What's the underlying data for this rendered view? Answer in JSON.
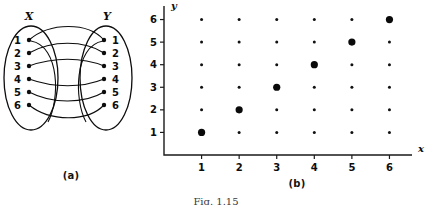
{
  "figure": {
    "number_label": "Fig. 1.15",
    "panel_a_caption": "(a)",
    "panel_b_caption": "(b)"
  },
  "arrow_diagram": {
    "left_set_label": "X",
    "right_set_label": "Y",
    "left_elements": [
      "1",
      "2",
      "3",
      "4",
      "5",
      "6"
    ],
    "right_elements": [
      "1",
      "2",
      "3",
      "4",
      "5",
      "6"
    ],
    "mappings": [
      {
        "from": "1",
        "to": "1"
      },
      {
        "from": "2",
        "to": "2"
      },
      {
        "from": "3",
        "to": "3"
      },
      {
        "from": "4",
        "to": "4"
      },
      {
        "from": "5",
        "to": "5"
      },
      {
        "from": "6",
        "to": "6"
      }
    ]
  },
  "chart_data": {
    "type": "scatter",
    "title": "",
    "subtitle": "",
    "xlabel": "x",
    "ylabel": "y",
    "xlim": [
      0,
      6.6
    ],
    "ylim": [
      0,
      6.6
    ],
    "xticks": [
      "1",
      "2",
      "3",
      "4",
      "5",
      "6"
    ],
    "yticks": [
      "1",
      "2",
      "3",
      "4",
      "5",
      "6"
    ],
    "grid": false,
    "legend": "none",
    "annotation": "Large dots mark the identity relation (x = y); small dots mark the full Cartesian product X x Y.",
    "series": [
      {
        "name": "cartesian-product",
        "marker": "small-dot",
        "points": [
          [
            1,
            1
          ],
          [
            1,
            2
          ],
          [
            1,
            3
          ],
          [
            1,
            4
          ],
          [
            1,
            5
          ],
          [
            1,
            6
          ],
          [
            2,
            1
          ],
          [
            2,
            2
          ],
          [
            2,
            3
          ],
          [
            2,
            4
          ],
          [
            2,
            5
          ],
          [
            2,
            6
          ],
          [
            3,
            1
          ],
          [
            3,
            2
          ],
          [
            3,
            3
          ],
          [
            3,
            4
          ],
          [
            3,
            5
          ],
          [
            3,
            6
          ],
          [
            4,
            1
          ],
          [
            4,
            2
          ],
          [
            4,
            3
          ],
          [
            4,
            4
          ],
          [
            4,
            5
          ],
          [
            4,
            6
          ],
          [
            5,
            1
          ],
          [
            5,
            2
          ],
          [
            5,
            3
          ],
          [
            5,
            4
          ],
          [
            5,
            5
          ],
          [
            5,
            6
          ],
          [
            6,
            1
          ],
          [
            6,
            2
          ],
          [
            6,
            3
          ],
          [
            6,
            4
          ],
          [
            6,
            5
          ],
          [
            6,
            6
          ]
        ]
      },
      {
        "name": "identity-relation",
        "marker": "large-dot",
        "points": [
          [
            1,
            1
          ],
          [
            2,
            2
          ],
          [
            3,
            3
          ],
          [
            4,
            4
          ],
          [
            5,
            5
          ],
          [
            6,
            6
          ]
        ]
      }
    ],
    "colors": {
      "marker": "#111111",
      "axis": "#1a1a1a",
      "background": "#ffffff"
    }
  }
}
